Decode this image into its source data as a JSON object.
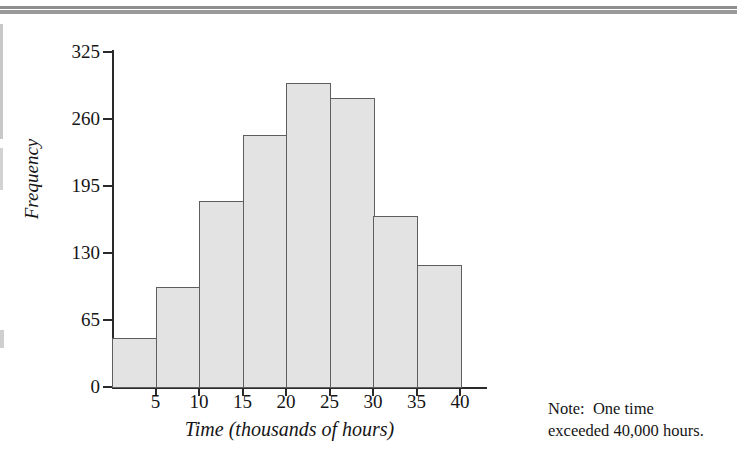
{
  "figure": {
    "note": {
      "line1": "Note:  One time",
      "line2": "exceeded 40,000 hours."
    }
  },
  "chart_data": {
    "type": "bar",
    "subtype": "histogram",
    "title": "",
    "xlabel": "Time (thousands of hours)",
    "ylabel": "Frequency",
    "categories": [
      "0-5",
      "5-10",
      "10-15",
      "15-20",
      "20-25",
      "25-30",
      "30-35",
      "35-40"
    ],
    "bin_edges": [
      0,
      5,
      10,
      15,
      20,
      25,
      30,
      35,
      40
    ],
    "values": [
      48,
      97,
      180,
      244,
      295,
      280,
      166,
      118
    ],
    "xlim": [
      0,
      43
    ],
    "ylim": [
      0,
      325
    ],
    "xticks": [
      5,
      10,
      15,
      20,
      25,
      30,
      35,
      40
    ],
    "xticklabels": [
      "5",
      "10",
      "15",
      "20",
      "25",
      "30",
      "35",
      "40"
    ],
    "yticks": [
      0,
      65,
      130,
      195,
      260,
      325
    ],
    "yticklabels": [
      "0",
      "65",
      "130",
      "195",
      "260",
      "325"
    ],
    "grid": false,
    "legend": null,
    "bar_fill_color": "#e3e3e3",
    "bar_edge_color": "#5e5e5e",
    "axis_color": "#2a2a2a",
    "annotations": [
      "Note:  One time",
      "exceeded 40,000 hours."
    ]
  }
}
